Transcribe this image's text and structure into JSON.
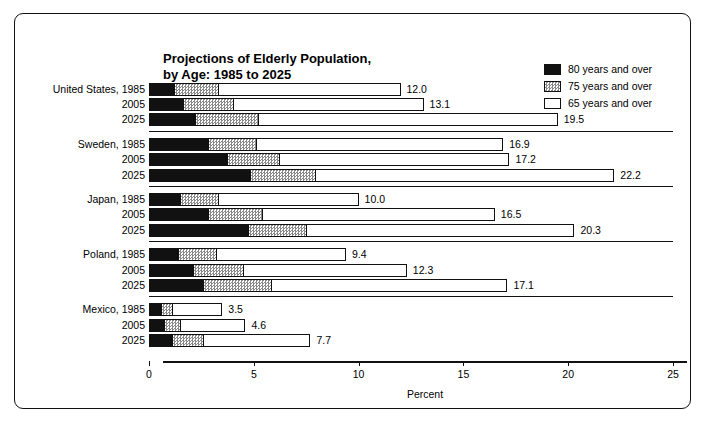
{
  "chart_data": {
    "type": "bar",
    "orientation": "horizontal",
    "stacked": true,
    "title": "Projections of Elderly Population, by Age:  1985 to 2025",
    "title_lines": [
      "Projections of Elderly Population,",
      "by Age:  1985 to 2025"
    ],
    "xlabel": "Percent",
    "ylabel": "",
    "xlim": [
      0,
      25
    ],
    "xticks": [
      0,
      5,
      10,
      15,
      20,
      25
    ],
    "xticklabels": [
      "0",
      "5",
      "10",
      "15",
      "20",
      "25"
    ],
    "grid": false,
    "legend_position": "top-right",
    "legend": [
      "80 years and over",
      "75 years and over",
      "65 years and over"
    ],
    "series": [
      {
        "name": "80 years and over",
        "key": "s80",
        "color": "#111111",
        "fill": "solid-black"
      },
      {
        "name": "75 years and over",
        "key": "s75",
        "color": "#8a8a8a",
        "fill": "gray-checker"
      },
      {
        "name": "65 years and over",
        "key": "s65",
        "color": "#ffffff",
        "fill": "white"
      }
    ],
    "groups": [
      {
        "country": "United States",
        "rows": [
          {
            "label": "United States, 1985",
            "year": "1985",
            "s80": 1.2,
            "s75": 2.1,
            "s65": 8.7,
            "total": 12.0,
            "total_label": "12.0"
          },
          {
            "label": "2005",
            "year": "2005",
            "s80": 1.6,
            "s75": 2.4,
            "s65": 9.1,
            "total": 13.1,
            "total_label": "13.1"
          },
          {
            "label": "2025",
            "year": "2025",
            "s80": 2.2,
            "s75": 3.0,
            "s65": 14.3,
            "total": 19.5,
            "total_label": "19.5"
          }
        ]
      },
      {
        "country": "Sweden",
        "rows": [
          {
            "label": "Sweden, 1985",
            "year": "1985",
            "s80": 2.8,
            "s75": 2.3,
            "s65": 11.8,
            "total": 16.9,
            "total_label": "16.9"
          },
          {
            "label": "2005",
            "year": "2005",
            "s80": 3.7,
            "s75": 2.5,
            "s65": 11.0,
            "total": 17.2,
            "total_label": "17.2"
          },
          {
            "label": "2025",
            "year": "2025",
            "s80": 4.8,
            "s75": 3.1,
            "s65": 14.3,
            "total": 22.2,
            "total_label": "22.2"
          }
        ]
      },
      {
        "country": "Japan",
        "rows": [
          {
            "label": "Japan, 1985",
            "year": "1985",
            "s80": 1.5,
            "s75": 1.8,
            "s65": 6.7,
            "total": 10.0,
            "total_label": "10.0"
          },
          {
            "label": "2005",
            "year": "2005",
            "s80": 2.8,
            "s75": 2.6,
            "s65": 11.1,
            "total": 16.5,
            "total_label": "16.5"
          },
          {
            "label": "2025",
            "year": "2025",
            "s80": 4.7,
            "s75": 2.8,
            "s65": 12.8,
            "total": 20.3,
            "total_label": "20.3"
          }
        ]
      },
      {
        "country": "Poland",
        "rows": [
          {
            "label": "Poland, 1985",
            "year": "1985",
            "s80": 1.4,
            "s75": 1.8,
            "s65": 6.2,
            "total": 9.4,
            "total_label": "9.4"
          },
          {
            "label": "2005",
            "year": "2005",
            "s80": 2.1,
            "s75": 2.4,
            "s65": 7.8,
            "total": 12.3,
            "total_label": "12.3"
          },
          {
            "label": "2025",
            "year": "2025",
            "s80": 2.6,
            "s75": 3.2,
            "s65": 11.3,
            "total": 17.1,
            "total_label": "17.1"
          }
        ]
      },
      {
        "country": "Mexico",
        "rows": [
          {
            "label": "Mexico, 1985",
            "year": "1985",
            "s80": 0.55,
            "s75": 0.55,
            "s65": 2.4,
            "total": 3.5,
            "total_label": "3.5"
          },
          {
            "label": "2005",
            "year": "2005",
            "s80": 0.7,
            "s75": 0.8,
            "s65": 3.1,
            "total": 4.6,
            "total_label": "4.6"
          },
          {
            "label": "2025",
            "year": "2025",
            "s80": 1.1,
            "s75": 1.5,
            "s65": 5.1,
            "total": 7.7,
            "total_label": "7.7"
          }
        ]
      }
    ]
  }
}
